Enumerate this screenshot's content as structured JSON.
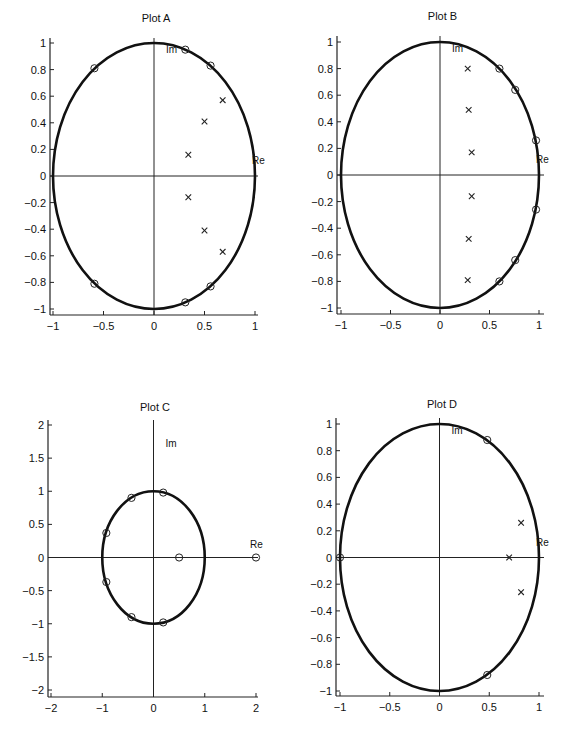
{
  "chart_data": [
    {
      "type": "scatter",
      "title": "Plot A",
      "xlabel": "Re",
      "ylabel": "Im",
      "xlim": [
        -1,
        1
      ],
      "ylim": [
        -1,
        1
      ],
      "xticks": [
        "-1",
        "-0.5",
        "0",
        "0.5",
        "1"
      ],
      "yticks": [
        "-1",
        "-0.8",
        "-0.6",
        "-0.4",
        "-0.2",
        "0",
        "0.2",
        "0.4",
        "0.6",
        "0.8",
        "1"
      ],
      "unit_circle": true,
      "series": [
        {
          "name": "zeros",
          "marker": "o",
          "points": [
            [
              -0.59,
              0.81
            ],
            [
              -0.59,
              -0.81
            ],
            [
              0.31,
              0.95
            ],
            [
              0.31,
              -0.95
            ],
            [
              0.56,
              0.83
            ],
            [
              0.56,
              -0.83
            ]
          ]
        },
        {
          "name": "poles",
          "marker": "x",
          "points": [
            [
              0.34,
              0.16
            ],
            [
              0.34,
              -0.16
            ],
            [
              0.5,
              0.41
            ],
            [
              0.5,
              -0.41
            ],
            [
              0.68,
              0.57
            ],
            [
              0.68,
              -0.57
            ]
          ]
        }
      ]
    },
    {
      "type": "scatter",
      "title": "Plot B",
      "xlabel": "Re",
      "ylabel": "Im",
      "xlim": [
        -1,
        1
      ],
      "ylim": [
        -1,
        1
      ],
      "xticks": [
        "-1",
        "-0.5",
        "0",
        "0.5",
        "1"
      ],
      "yticks": [
        "-1",
        "-0.8",
        "-0.6",
        "-0.4",
        "-0.2",
        "0",
        "0.2",
        "0.4",
        "0.6",
        "0.8",
        "1"
      ],
      "unit_circle": true,
      "series": [
        {
          "name": "zeros",
          "marker": "o",
          "points": [
            [
              0.6,
              0.8
            ],
            [
              0.6,
              -0.8
            ],
            [
              0.76,
              0.64
            ],
            [
              0.76,
              -0.64
            ],
            [
              0.97,
              0.26
            ],
            [
              0.97,
              -0.26
            ]
          ]
        },
        {
          "name": "poles",
          "marker": "x",
          "points": [
            [
              0.28,
              0.8
            ],
            [
              0.28,
              -0.79
            ],
            [
              0.29,
              0.49
            ],
            [
              0.29,
              -0.48
            ],
            [
              0.32,
              0.17
            ],
            [
              0.32,
              -0.16
            ]
          ]
        }
      ]
    },
    {
      "type": "scatter",
      "title": "Plot C",
      "xlabel": "Re",
      "ylabel": "Im",
      "xlim": [
        -2,
        2
      ],
      "ylim": [
        -2,
        2
      ],
      "xticks": [
        "-2",
        "-1",
        "0",
        "1",
        "2"
      ],
      "yticks": [
        "-2",
        "-1.5",
        "-1",
        "-0.5",
        "0",
        "0.5",
        "1",
        "1.5",
        "2"
      ],
      "unit_circle": true,
      "series": [
        {
          "name": "zeros",
          "marker": "o",
          "points": [
            [
              0.19,
              0.98
            ],
            [
              0.19,
              -0.98
            ],
            [
              -0.43,
              0.9
            ],
            [
              -0.43,
              -0.9
            ],
            [
              -0.92,
              0.37
            ],
            [
              -0.92,
              -0.37
            ],
            [
              0.5,
              0
            ],
            [
              2,
              0
            ]
          ]
        },
        {
          "name": "poles",
          "marker": "x",
          "points": []
        }
      ]
    },
    {
      "type": "scatter",
      "title": "Plot D",
      "xlabel": "Re",
      "ylabel": "Im",
      "xlim": [
        -1,
        1
      ],
      "ylim": [
        -1,
        1
      ],
      "xticks": [
        "-1",
        "-0.5",
        "0",
        "0.5",
        "1"
      ],
      "yticks": [
        "-1",
        "-0.8",
        "-0.6",
        "-0.4",
        "-0.2",
        "0",
        "0.2",
        "0.4",
        "0.6",
        "0.8",
        "1"
      ],
      "unit_circle": true,
      "series": [
        {
          "name": "zeros",
          "marker": "o",
          "points": [
            [
              0.48,
              0.88
            ],
            [
              0.48,
              -0.88
            ],
            [
              -1,
              0
            ]
          ]
        },
        {
          "name": "poles",
          "marker": "x",
          "points": [
            [
              0.7,
              0
            ],
            [
              0.82,
              0.26
            ],
            [
              0.82,
              -0.26
            ]
          ]
        }
      ]
    }
  ]
}
